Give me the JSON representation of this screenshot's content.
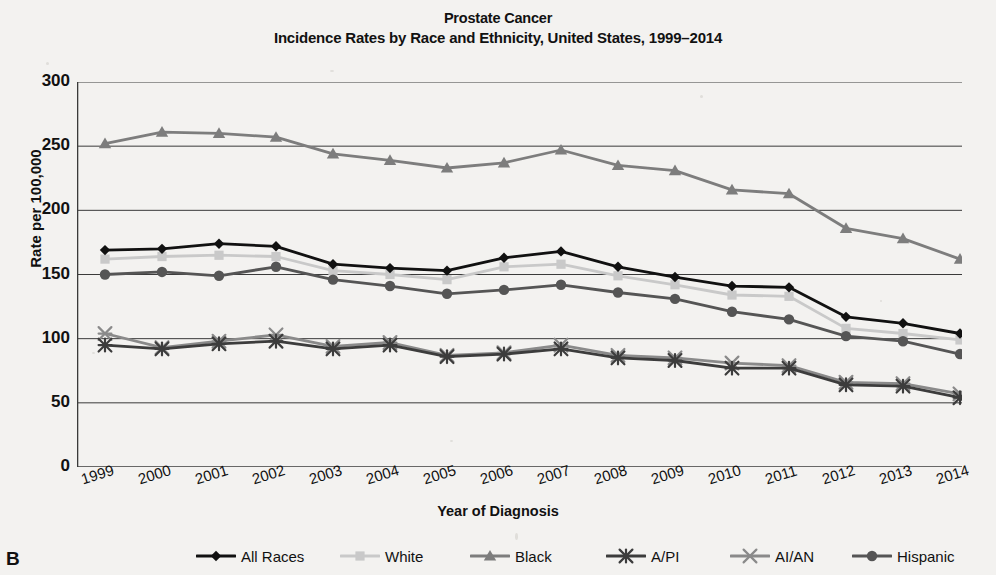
{
  "title": {
    "line1": "Prostate Cancer",
    "line2": "Incidence Rates by Race and Ethnicity, United States, 1999–2014"
  },
  "panel_letter": "B",
  "axes": {
    "ylabel": "Rate per 100,000",
    "xlabel": "Year of Diagnosis",
    "yticks": [
      "0",
      "50",
      "100",
      "150",
      "200",
      "250",
      "300"
    ],
    "xticks": [
      "1999",
      "2000",
      "2001",
      "2002",
      "2003",
      "2004",
      "2005",
      "2006",
      "2007",
      "2008",
      "2009",
      "2010",
      "2011",
      "2012",
      "2013",
      "2014"
    ]
  },
  "colors": {
    "all_races": "#111111",
    "white": "#c9c9c9",
    "black": "#7d7d7d",
    "api": "#3c3c3c",
    "aian": "#8a8a8a",
    "hispanic": "#555555",
    "grid": "#3a3a3a",
    "background": "#f3f2f0"
  },
  "chart_data": {
    "type": "line",
    "title": "Prostate Cancer Incidence Rates by Race and Ethnicity, United States, 1999–2014",
    "xlabel": "Year of Diagnosis",
    "ylabel": "Rate per 100,000",
    "x": [
      1999,
      2000,
      2001,
      2002,
      2003,
      2004,
      2005,
      2006,
      2007,
      2008,
      2009,
      2010,
      2011,
      2012,
      2013,
      2014
    ],
    "xlim": [
      1999,
      2014
    ],
    "ylim": [
      0,
      300
    ],
    "ytick_step": 50,
    "yminor_step": 10,
    "grid": "horizontal-major",
    "legend_position": "bottom",
    "series": [
      {
        "name": "All Races",
        "marker": "diamond",
        "color": "#111111",
        "values": [
          169,
          170,
          174,
          172,
          158,
          155,
          153,
          163,
          168,
          156,
          148,
          141,
          140,
          117,
          112,
          104
        ]
      },
      {
        "name": "White",
        "marker": "square",
        "color": "#c9c9c9",
        "values": [
          162,
          164,
          165,
          164,
          153,
          150,
          146,
          156,
          158,
          149,
          142,
          134,
          133,
          108,
          104,
          99
        ]
      },
      {
        "name": "Black",
        "marker": "triangle",
        "color": "#7d7d7d",
        "values": [
          252,
          261,
          260,
          257,
          244,
          239,
          233,
          237,
          247,
          235,
          231,
          216,
          213,
          186,
          178,
          162
        ]
      },
      {
        "name": "A/PI",
        "marker": "asterisk",
        "color": "#3c3c3c",
        "values": [
          95,
          92,
          96,
          98,
          92,
          95,
          86,
          88,
          92,
          85,
          83,
          77,
          77,
          64,
          63,
          54
        ]
      },
      {
        "name": "AI/AN",
        "marker": "x",
        "color": "#8a8a8a",
        "values": [
          104,
          93,
          98,
          103,
          94,
          97,
          87,
          89,
          95,
          87,
          85,
          81,
          79,
          66,
          65,
          57
        ]
      },
      {
        "name": "Hispanic",
        "marker": "circle",
        "color": "#555555",
        "values": [
          150,
          152,
          149,
          156,
          146,
          141,
          135,
          138,
          142,
          136,
          131,
          121,
          115,
          102,
          98,
          88
        ]
      }
    ]
  },
  "legend": [
    {
      "label": "All Races",
      "marker": "diamond",
      "color": "#111111"
    },
    {
      "label": "White",
      "marker": "square",
      "color": "#c9c9c9"
    },
    {
      "label": "Black",
      "marker": "triangle",
      "color": "#7d7d7d"
    },
    {
      "label": "A/PI",
      "marker": "asterisk",
      "color": "#3c3c3c"
    },
    {
      "label": "AI/AN",
      "marker": "x",
      "color": "#8a8a8a"
    },
    {
      "label": "Hispanic",
      "marker": "circle",
      "color": "#555555"
    }
  ]
}
